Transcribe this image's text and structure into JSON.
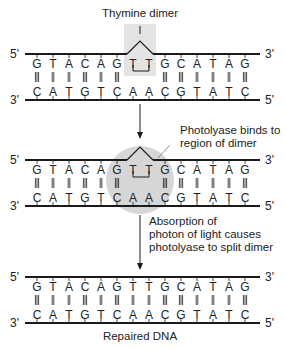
{
  "title_top": "Thymine dimer",
  "caption_bottom": "Repaired DNA",
  "annotations": {
    "photolyase_binds": [
      "Photolyase binds to",
      "region of dimer"
    ],
    "absorption": [
      "Absorption of",
      "photon of light causes",
      "photolyase to split dimer"
    ]
  },
  "strands": {
    "top_sequence": [
      "G",
      "T",
      "A",
      "C",
      "A",
      "G",
      "T",
      "T",
      "G",
      "C",
      "A",
      "T",
      "A",
      "G"
    ],
    "bottom_sequence": [
      "C",
      "A",
      "T",
      "G",
      "T",
      "C",
      "A",
      "A",
      "C",
      "G",
      "T",
      "A",
      "T",
      "C"
    ],
    "bonds": [
      3,
      2,
      2,
      3,
      2,
      3,
      0,
      0,
      3,
      3,
      2,
      2,
      2,
      3
    ],
    "bonds_repaired": [
      3,
      2,
      2,
      3,
      2,
      3,
      2,
      2,
      3,
      3,
      2,
      2,
      2,
      3
    ],
    "top_left_end": "5'",
    "top_right_end": "3'",
    "bottom_left_end": "3'",
    "bottom_right_end": "5'"
  },
  "panels": [
    {
      "name": "thymine-dimer-panel",
      "top_y": 54,
      "dimer": true,
      "highlight": "box"
    },
    {
      "name": "photolyase-binding-panel",
      "top_y": 160,
      "dimer": true,
      "highlight": "circle"
    },
    {
      "name": "repaired-dna-panel",
      "top_y": 277,
      "dimer": false,
      "highlight": "none"
    }
  ],
  "colors": {
    "line": "#1a1a1a",
    "text": "#222222",
    "highlight_box": "#e3e3e3",
    "photolyase_circle": "#d6d6d6"
  }
}
